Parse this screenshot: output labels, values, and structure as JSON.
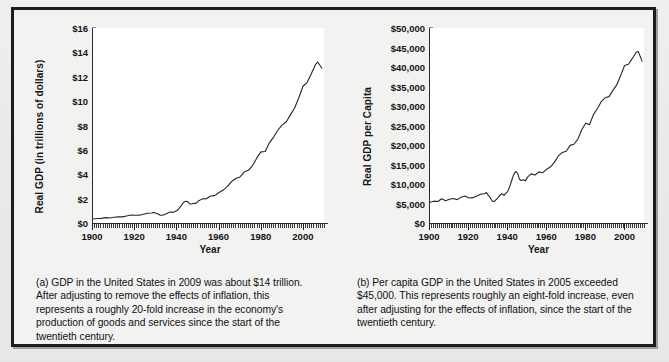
{
  "figure": {
    "background_color": "#ececeb",
    "frame_color": "#1c1c1c",
    "line_color": "#262626"
  },
  "panel_a": {
    "caption": "(a) GDP in the United States in 2009 was about $14 trillion. After adjusting to remove the effects of inflation, this represents a roughly 20-fold increase in the economy's production of goods and services since the start of the twentieth century."
  },
  "panel_b": {
    "caption": "(b) Per capita GDP in the United States in 2005 exceeded $45,000. This represents roughly an eight-fold increase, even after adjusting for the effects of inflation, since the start of the twentieth century."
  },
  "chart_data": [
    {
      "id": "real-gdp",
      "type": "line",
      "title": "",
      "xlabel": "Year",
      "ylabel": "Real GDP (in trillions of dollars)",
      "xlim": [
        1900,
        2010
      ],
      "ylim": [
        0,
        16
      ],
      "xticks": [
        1900,
        1920,
        1940,
        1960,
        1980,
        2000
      ],
      "xticklabels": [
        "1900",
        "1920",
        "1940",
        "1960",
        "1980",
        "2000"
      ],
      "yticks": [
        0,
        2,
        4,
        6,
        8,
        10,
        12,
        14,
        16
      ],
      "yticklabels": [
        "$0",
        "$2",
        "$4",
        "$6",
        "$8",
        "$10",
        "$12",
        "$14",
        "$16"
      ],
      "grid": false,
      "legend": "none",
      "x": [
        1900,
        1902,
        1904,
        1906,
        1908,
        1910,
        1912,
        1914,
        1916,
        1918,
        1920,
        1922,
        1924,
        1926,
        1928,
        1929,
        1930,
        1931,
        1932,
        1933,
        1934,
        1935,
        1936,
        1937,
        1938,
        1939,
        1940,
        1941,
        1942,
        1943,
        1944,
        1945,
        1946,
        1947,
        1948,
        1949,
        1950,
        1952,
        1954,
        1956,
        1958,
        1960,
        1962,
        1964,
        1966,
        1968,
        1970,
        1972,
        1974,
        1976,
        1978,
        1980,
        1982,
        1984,
        1986,
        1988,
        1990,
        1992,
        1994,
        1996,
        1998,
        2000,
        2002,
        2004,
        2006,
        2007,
        2009
      ],
      "values": [
        0.33,
        0.37,
        0.38,
        0.44,
        0.41,
        0.47,
        0.5,
        0.5,
        0.58,
        0.66,
        0.63,
        0.64,
        0.72,
        0.8,
        0.82,
        0.87,
        0.8,
        0.74,
        0.64,
        0.63,
        0.7,
        0.76,
        0.86,
        0.9,
        0.87,
        0.94,
        1.02,
        1.2,
        1.42,
        1.66,
        1.79,
        1.77,
        1.57,
        1.56,
        1.62,
        1.61,
        1.78,
        1.98,
        1.99,
        2.21,
        2.25,
        2.5,
        2.7,
        3.01,
        3.4,
        3.65,
        3.78,
        4.18,
        4.32,
        4.71,
        5.34,
        5.84,
        5.87,
        6.58,
        7.05,
        7.61,
        8.03,
        8.29,
        8.87,
        9.43,
        10.28,
        11.22,
        11.54,
        12.26,
        13.02,
        13.21,
        12.7
      ]
    },
    {
      "id": "real-gdp-per-capita",
      "type": "line",
      "title": "",
      "xlabel": "Year",
      "ylabel": "Real GDP per Capita",
      "xlim": [
        1900,
        2010
      ],
      "ylim": [
        0,
        50000
      ],
      "xticks": [
        1900,
        1920,
        1940,
        1960,
        1980,
        2000
      ],
      "xticklabels": [
        "1900",
        "1920",
        "1940",
        "1960",
        "1980",
        "2000"
      ],
      "yticks": [
        0,
        5000,
        10000,
        15000,
        20000,
        25000,
        30000,
        35000,
        40000,
        45000,
        50000
      ],
      "yticklabels": [
        "$0",
        "$5,000",
        "$10,000",
        "$15,000",
        "$20,000",
        "$25,000",
        "$30,000",
        "$35,000",
        "$40,000",
        "$45,000",
        "$50,000"
      ],
      "grid": false,
      "legend": "none",
      "x": [
        1900,
        1902,
        1904,
        1906,
        1908,
        1910,
        1912,
        1914,
        1916,
        1918,
        1920,
        1922,
        1924,
        1926,
        1928,
        1929,
        1930,
        1931,
        1932,
        1933,
        1934,
        1935,
        1936,
        1937,
        1938,
        1939,
        1940,
        1941,
        1942,
        1943,
        1944,
        1945,
        1946,
        1947,
        1948,
        1949,
        1950,
        1952,
        1954,
        1956,
        1958,
        1960,
        1962,
        1964,
        1966,
        1968,
        1970,
        1972,
        1974,
        1976,
        1978,
        1980,
        1982,
        1984,
        1986,
        1988,
        1990,
        1992,
        1994,
        1996,
        1998,
        2000,
        2002,
        2004,
        2006,
        2007,
        2009
      ],
      "values": [
        5300,
        5600,
        5500,
        6200,
        5700,
        6100,
        6300,
        6000,
        6600,
        6900,
        6400,
        6500,
        6900,
        7400,
        7500,
        7800,
        7100,
        6500,
        5600,
        5500,
        6000,
        6500,
        7200,
        7500,
        7100,
        7600,
        8100,
        9400,
        10900,
        12400,
        13200,
        12800,
        11200,
        10900,
        11100,
        10800,
        11700,
        12600,
        12300,
        13100,
        12900,
        13800,
        14400,
        15600,
        17200,
        18100,
        18400,
        19900,
        20200,
        21500,
        23900,
        25600,
        25200,
        27800,
        29300,
        31100,
        32100,
        32400,
        34000,
        35400,
        37800,
        40400,
        40700,
        42200,
        43800,
        44000,
        41500
      ]
    }
  ]
}
